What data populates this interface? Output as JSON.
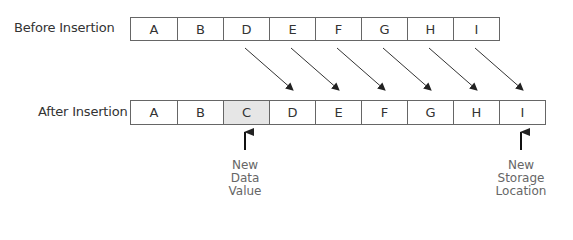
{
  "before": {
    "label": "Before Insertion",
    "cells": [
      "A",
      "B",
      "D",
      "E",
      "F",
      "G",
      "H",
      "I"
    ]
  },
  "after": {
    "label": "After Insertion",
    "cells": [
      "A",
      "B",
      "C",
      "D",
      "E",
      "F",
      "G",
      "H",
      "I"
    ],
    "highlighted_index": 2
  },
  "annotations": {
    "new_data": [
      "New",
      "Data",
      "Value"
    ],
    "new_storage": [
      "New",
      "Storage",
      "Location"
    ]
  },
  "colors": {
    "border": "#666666",
    "highlight": "#e6e6e6",
    "arrow": "#222222"
  }
}
